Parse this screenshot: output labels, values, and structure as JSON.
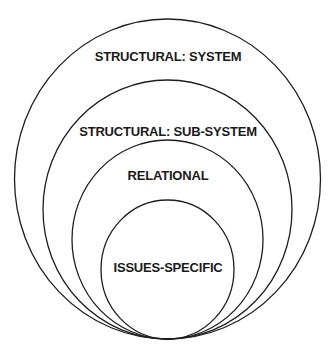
{
  "diagram": {
    "type": "nested-circles",
    "stroke_color": "#1e1e1e",
    "background": "#ffffff",
    "layers": [
      {
        "label": "STRUCTURAL: SYSTEM",
        "cx": 167.5,
        "cy": 179,
        "rx": 153,
        "ry": 160,
        "label_y": 61
      },
      {
        "label": "STRUCTURAL: SUB-SYSTEM",
        "cx": 167.5,
        "cy": 209.5,
        "rx": 124.5,
        "ry": 129.5,
        "label_y": 136
      },
      {
        "label": "RELATIONAL",
        "cx": 167.5,
        "cy": 239.5,
        "rx": 95.5,
        "ry": 99.5,
        "label_y": 180
      },
      {
        "label": "ISSUES-SPECIFIC",
        "cx": 167.5,
        "cy": 269.5,
        "rx": 66.5,
        "ry": 69.5,
        "label_y": 272
      }
    ]
  }
}
